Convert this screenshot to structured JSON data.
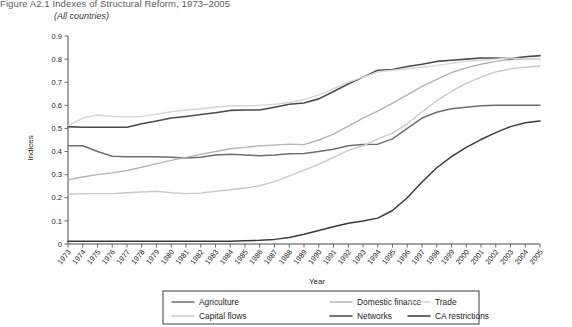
{
  "figure": {
    "title": "Figure A2.1  Indexes of Structural Reform, 1973–2005",
    "subtitle": "(All countries)"
  },
  "chart_data": {
    "type": "line",
    "title": "Figure A2.1  Indexes of Structural Reform, 1973–2005",
    "subtitle": "(All countries)",
    "xlabel": "Year",
    "ylabel": "Indices",
    "ylim": [
      0,
      0.9
    ],
    "ytick_labels": [
      "0",
      "0.1",
      "0.2",
      "0.3",
      "0.4",
      "0.5",
      "0.6",
      "0.7",
      "0.8",
      "0.9"
    ],
    "ytick_values": [
      0,
      0.1,
      0.2,
      0.3,
      0.4,
      0.5,
      0.6,
      0.7,
      0.8,
      0.9
    ],
    "grid": false,
    "legend_position": "bottom",
    "categories": [
      "1973",
      "1974",
      "1975",
      "1976",
      "1977",
      "1978",
      "1979",
      "1980",
      "1981",
      "1982",
      "1983",
      "1984",
      "1985",
      "1986",
      "1987",
      "1988",
      "1989",
      "1990",
      "1991",
      "1992",
      "1993",
      "1994",
      "1995",
      "1996",
      "1997",
      "1998",
      "1999",
      "2000",
      "2001",
      "2002",
      "2003",
      "2004",
      "2005"
    ],
    "series": [
      {
        "name": "Agriculture",
        "color": "#6e6e6e",
        "width": 1.5,
        "values": [
          0.425,
          0.425,
          0.4,
          0.38,
          0.378,
          0.378,
          0.378,
          0.375,
          0.372,
          0.375,
          0.385,
          0.388,
          0.385,
          0.382,
          0.385,
          0.39,
          0.392,
          0.4,
          0.41,
          0.425,
          0.43,
          0.432,
          0.455,
          0.5,
          0.545,
          0.57,
          0.585,
          0.592,
          0.598,
          0.6,
          0.6,
          0.6,
          0.6
        ]
      },
      {
        "name": "Capital flows",
        "color": "#c9c9c9",
        "width": 1.4,
        "values": [
          0.215,
          0.218,
          0.218,
          0.218,
          0.222,
          0.225,
          0.228,
          0.222,
          0.218,
          0.22,
          0.228,
          0.235,
          0.242,
          0.252,
          0.27,
          0.295,
          0.32,
          0.345,
          0.375,
          0.405,
          0.425,
          0.455,
          0.48,
          0.52,
          0.572,
          0.62,
          0.66,
          0.695,
          0.722,
          0.745,
          0.758,
          0.765,
          0.77
        ]
      },
      {
        "name": "Domestic finance",
        "color": "#b4b4b4",
        "width": 1.4,
        "values": [
          0.278,
          0.29,
          0.3,
          0.308,
          0.318,
          0.332,
          0.348,
          0.362,
          0.375,
          0.388,
          0.4,
          0.412,
          0.418,
          0.425,
          0.428,
          0.432,
          0.43,
          0.45,
          0.475,
          0.51,
          0.545,
          0.575,
          0.61,
          0.645,
          0.682,
          0.712,
          0.742,
          0.762,
          0.778,
          0.79,
          0.798,
          0.8,
          0.8
        ]
      },
      {
        "name": "Networks",
        "color": "#4a4a4a",
        "width": 1.6,
        "values": [
          0.508,
          0.505,
          0.505,
          0.505,
          0.505,
          0.52,
          0.532,
          0.545,
          0.552,
          0.56,
          0.568,
          0.578,
          0.58,
          0.58,
          0.592,
          0.605,
          0.61,
          0.628,
          0.66,
          0.692,
          0.722,
          0.752,
          0.755,
          0.768,
          0.778,
          0.79,
          0.795,
          0.8,
          0.805,
          0.805,
          0.802,
          0.81,
          0.815
        ]
      },
      {
        "name": "Trade",
        "color": "#d6d6d6",
        "width": 1.4,
        "values": [
          0.512,
          0.545,
          0.558,
          0.552,
          0.55,
          0.552,
          0.562,
          0.572,
          0.58,
          0.585,
          0.592,
          0.598,
          0.598,
          0.6,
          0.605,
          0.612,
          0.625,
          0.645,
          0.672,
          0.7,
          0.722,
          0.745,
          0.752,
          0.758,
          0.765,
          0.772,
          0.782,
          0.79,
          0.795,
          0.8,
          0.805,
          0.8,
          0.798
        ]
      },
      {
        "name": "CA restrictions",
        "color": "#3a3a3a",
        "width": 1.5,
        "values": [
          0.012,
          0.012,
          0.012,
          0.012,
          0.012,
          0.012,
          0.012,
          0.012,
          0.012,
          0.012,
          0.012,
          0.012,
          0.014,
          0.016,
          0.02,
          0.028,
          0.042,
          0.058,
          0.075,
          0.09,
          0.1,
          0.112,
          0.145,
          0.2,
          0.268,
          0.33,
          0.378,
          0.418,
          0.452,
          0.482,
          0.508,
          0.525,
          0.532
        ]
      }
    ]
  },
  "legend": {
    "entries": [
      {
        "label": "Agriculture"
      },
      {
        "label": "Capital flows"
      },
      {
        "label": "Domestic finance"
      },
      {
        "label": "Networks"
      },
      {
        "label": "Trade"
      },
      {
        "label": "CA restrictions"
      }
    ]
  }
}
